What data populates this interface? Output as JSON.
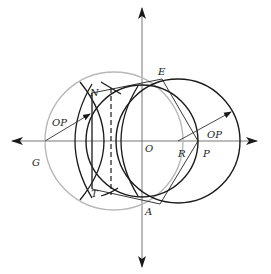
{
  "diagram": {
    "labels": {
      "N": "N",
      "E": "E",
      "O": "O",
      "P": "P",
      "R": "R",
      "A": "A",
      "T": "T",
      "G": "G",
      "op_left": "OP",
      "op_right": "OP"
    },
    "colors": {
      "stroke": "#1a1a1a",
      "gray_circle": "#b8b8b8",
      "axis": "#333333"
    }
  }
}
